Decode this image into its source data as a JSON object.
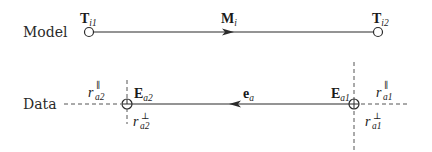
{
  "rows": {
    "model": {
      "label": "Model",
      "start_point": {
        "name": "T",
        "sub": "i1"
      },
      "end_point": {
        "name": "T",
        "sub": "i2"
      },
      "segment": {
        "name": "M",
        "sub": "i",
        "direction": "right"
      }
    },
    "data": {
      "label": "Data",
      "start_point": {
        "name": "E",
        "sub": "a2"
      },
      "end_point": {
        "name": "E",
        "sub": "a1"
      },
      "segment": {
        "name": "e",
        "sub": "a",
        "direction": "left"
      },
      "residuals": {
        "a2_parallel": {
          "name": "r",
          "sup": "∥",
          "sub": "a2"
        },
        "a2_perp": {
          "name": "r",
          "sup": "⊥",
          "sub": "a2"
        },
        "a1_parallel": {
          "name": "r",
          "sup": "∥",
          "sub": "a1"
        },
        "a1_perp": {
          "name": "r",
          "sup": "⊥",
          "sub": "a1"
        }
      }
    }
  },
  "colors": {
    "stroke": "#2b2b2b",
    "dashed": "#555555",
    "background": "#ffffff"
  }
}
